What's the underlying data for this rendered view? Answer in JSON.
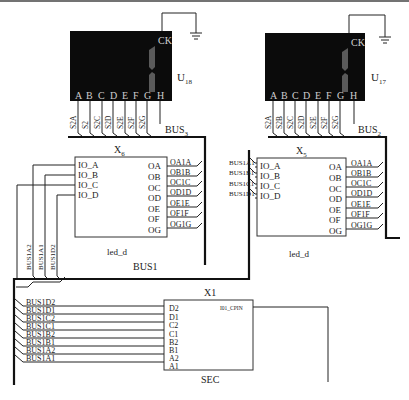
{
  "displays": [
    {
      "ref": "U",
      "sub": "18",
      "ck_label": "CK",
      "pins": [
        "A",
        "B",
        "C",
        "D",
        "E",
        "F",
        "G",
        "H"
      ],
      "wires": [
        "S2A",
        "S2",
        "S2C",
        "S2D",
        "S2E",
        "S2F",
        "S2G"
      ],
      "bus": "BUS",
      "bus_sub": "3"
    },
    {
      "ref": "U",
      "sub": "17",
      "ck_label": "CK",
      "pins": [
        "A",
        "B",
        "C",
        "D",
        "E",
        "F",
        "G",
        "H"
      ],
      "wires": [
        "S2A",
        "S2B",
        "S2C",
        "S2D",
        "S2E",
        "S2F",
        "S2G"
      ],
      "bus": "BUS",
      "bus_sub": "2"
    }
  ],
  "decoders": [
    {
      "ref": "X",
      "sub": "6",
      "name": "led_d",
      "inputs": [
        "IO_A",
        "IO_B",
        "IO_C",
        "IO_D"
      ],
      "outputs": [
        "OA",
        "OB",
        "OC",
        "OD",
        "OE",
        "OF",
        "OG"
      ],
      "out_wires": [
        "OA1A",
        "OB1B",
        "OC1C",
        "OD1D",
        "OE1E",
        "OF1F",
        "OG1G"
      ],
      "in_wires": [
        "BUS1A2",
        "BUS1A1",
        "BUS1D2"
      ]
    },
    {
      "ref": "X",
      "sub": "5",
      "name": "led_d",
      "inputs": [
        "IO_A",
        "IO_B",
        "IO_C",
        "IO_D"
      ],
      "outputs": [
        "OA",
        "OB",
        "OC",
        "OD",
        "OE",
        "OF",
        "OG"
      ],
      "out_wires": [
        "OA1A",
        "OB1B",
        "OC1C",
        "OD1D",
        "OE1E",
        "OF1F",
        "OG1G"
      ],
      "in_wires": [
        "BUS1A1",
        "BUS1B1",
        "BUS1C1",
        "BUS1D1"
      ]
    }
  ],
  "bus1_label": "BUS1",
  "sec": {
    "ref": "X1",
    "name": "SEC",
    "inputs": [
      "D2",
      "D1",
      "C2",
      "C1",
      "B2",
      "B1",
      "A2",
      "A1"
    ],
    "output": "I01_CPIN",
    "in_wires": [
      "BUS1D2",
      "BUS1D1",
      "BUS1C2",
      "BUS1C1",
      "BUS1B2",
      "BUS1B1",
      "BUS1A2",
      "BUS1A1"
    ]
  }
}
